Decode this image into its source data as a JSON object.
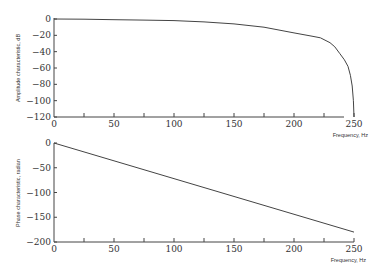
{
  "chart_data": [
    {
      "type": "line",
      "title": "",
      "xlabel": "Frequency, Hz",
      "ylabel": "Amplitude characteristic, dB",
      "xlim": [
        0,
        250
      ],
      "ylim": [
        -120,
        0
      ],
      "x_ticks": [
        0,
        50,
        100,
        150,
        200,
        250
      ],
      "y_ticks": [
        0,
        -20,
        -40,
        -60,
        -80,
        -100,
        -120
      ],
      "grid": false,
      "series": [
        {
          "name": "amplitude",
          "x": [
            0,
            25,
            50,
            75,
            100,
            125,
            150,
            175,
            200,
            215,
            222,
            230,
            234,
            238,
            242,
            245,
            247,
            248.5,
            249.5,
            250
          ],
          "values": [
            0,
            -0.3,
            -0.8,
            -1.3,
            -2,
            -3.5,
            -6,
            -10,
            -17,
            -21,
            -23,
            -29,
            -34,
            -42,
            -50,
            -58,
            -69,
            -82,
            -100,
            -120
          ]
        }
      ]
    },
    {
      "type": "line",
      "title": "",
      "xlabel": "Frequency, Hz",
      "ylabel": "Phase characteristic, radian",
      "xlim": [
        0,
        250
      ],
      "ylim": [
        -200,
        0
      ],
      "x_ticks": [
        0,
        50,
        100,
        150,
        200,
        250
      ],
      "y_ticks": [
        0,
        -50,
        -100,
        -150,
        -200
      ],
      "grid": false,
      "series": [
        {
          "name": "phase",
          "x": [
            0,
            250
          ],
          "values": [
            0,
            -180
          ]
        }
      ]
    }
  ],
  "labels": {
    "top_ylabel": "Amplitude characteristic, dB",
    "top_xlabel": "Frequency, Hz",
    "bottom_ylabel": "Phase characteristic, radian",
    "bottom_xlabel": "Frequency, Hz"
  }
}
